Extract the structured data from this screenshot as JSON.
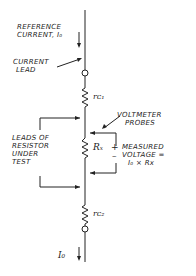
{
  "labels": {
    "reference_current": [
      "REFERENCE",
      "CURRENT, I₀"
    ],
    "current_lead": [
      "CURRENT",
      "LEAD"
    ],
    "voltmeter_probes": [
      "VOLTMETER",
      "PROBES"
    ],
    "leads_of_resistor": [
      "LEADS OF",
      "RESISTOR",
      "UNDER",
      "TEST"
    ],
    "measured_voltage": [
      "MEASURED",
      "VOLTAGE =",
      "I₀ × Rx"
    ],
    "plus": "+",
    "minus": "–"
  },
  "components": {
    "rc1": "rᴄ₁",
    "rx": "Rₓ",
    "rc2": "rᴄ₂",
    "i0_bottom": "I₀"
  },
  "colors": {
    "line": "#222222",
    "background": "#ffffff"
  }
}
